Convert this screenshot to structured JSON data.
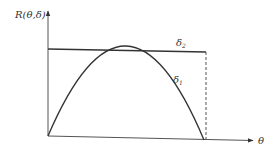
{
  "diagram": {
    "y_axis_label": "R(θ,δ)",
    "x_axis_label": "θ",
    "curves": [
      {
        "name": "δ2",
        "label": "δ",
        "subscript": "2",
        "shape": "horizontal line (constant risk)"
      },
      {
        "name": "δ1",
        "label": "δ",
        "subscript": "1",
        "shape": "concave parabola"
      }
    ],
    "annotation": "dashed vertical line at right end of θ range",
    "colors": {
      "stroke": "#333333",
      "background": "#ffffff"
    }
  }
}
